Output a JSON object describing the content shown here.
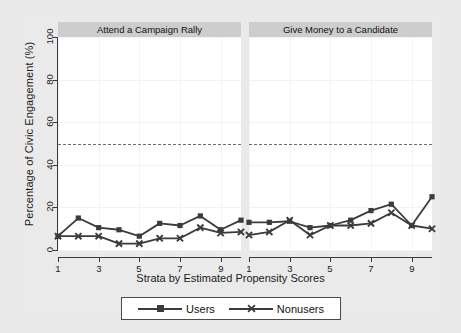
{
  "chart_data": {
    "type": "line",
    "title": "",
    "xlabel": "Strata by Estimated Propensity Scores",
    "ylabel": "Percentage of Civic Engagement (%)",
    "ylim": [
      0,
      100
    ],
    "xlim": [
      1,
      10
    ],
    "yticks": [
      0,
      20,
      40,
      60,
      80,
      100
    ],
    "xticks": [
      1,
      3,
      5,
      7,
      9
    ],
    "grid": true,
    "legend_position": "bottom",
    "reference_line": {
      "y": 50,
      "style": "dashed"
    },
    "x": [
      1,
      2,
      3,
      4,
      5,
      6,
      7,
      8,
      9,
      10
    ],
    "panels": [
      {
        "title": "Attend a Campaign Rally",
        "series": [
          {
            "name": "Users",
            "marker": "square",
            "values": [
              6.5,
              15,
              10.5,
              9.5,
              6.5,
              12.5,
              11.5,
              16,
              9.5,
              14
            ]
          },
          {
            "name": "Nonusers",
            "marker": "x",
            "values": [
              6.5,
              6.5,
              6.5,
              3,
              3,
              5.5,
              5.5,
              10.5,
              8,
              8.5
            ]
          }
        ]
      },
      {
        "title": "Give Money to a Candidate",
        "series": [
          {
            "name": "Users",
            "marker": "square",
            "values": [
              13,
              13,
              13.5,
              10.5,
              11.5,
              14,
              18.5,
              21.5,
              11.5,
              25
            ]
          },
          {
            "name": "Nonusers",
            "marker": "x",
            "values": [
              7,
              8.5,
              14,
              7,
              11.5,
              11.5,
              12.5,
              17.5,
              11.5,
              10
            ]
          }
        ]
      }
    ],
    "legend": [
      {
        "label": "Users",
        "marker": "square"
      },
      {
        "label": "Nonusers",
        "marker": "x"
      }
    ],
    "colors": {
      "series": "#3b3b3b",
      "panel_header_bg": "#cdcdcd",
      "figure_bg": "#e9e9e9",
      "plot_bg": "#ffffff",
      "axis": "#3a3a3a",
      "grid": "#f2f2f2",
      "refline": "#6e6e6e"
    }
  },
  "axis": {
    "ylabel": "Percentage of Civic Engagement (%)",
    "xlabel": "Strata by Estimated Propensity Scores",
    "ytick_labels": [
      "0",
      "20",
      "40",
      "60",
      "80",
      "100"
    ],
    "xtick_labels": [
      "1",
      "3",
      "5",
      "7",
      "9"
    ]
  },
  "panel_titles": {
    "left": "Attend a Campaign Rally",
    "right": "Give Money to a Candidate"
  },
  "legend_labels": {
    "users": "Users",
    "nonusers": "Nonusers"
  }
}
